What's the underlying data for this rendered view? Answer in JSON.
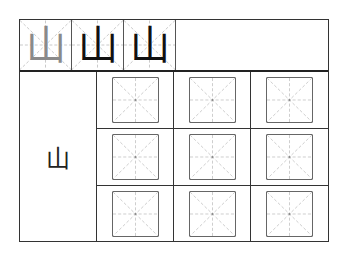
{
  "worksheet": {
    "character": "山",
    "header_examples": [
      {
        "char": "山",
        "color": "#8a8a8a"
      },
      {
        "char": "山",
        "color": "#111111"
      },
      {
        "char": "山",
        "color": "#111111"
      }
    ],
    "large_character": "山",
    "practice_grid": {
      "rows": 3,
      "cols": 3,
      "guide_style": "mi-zi-ge dashed guides"
    },
    "colors": {
      "border": "#333333",
      "guide_lines": "#aaaaaa",
      "box_border": "#666666"
    }
  }
}
